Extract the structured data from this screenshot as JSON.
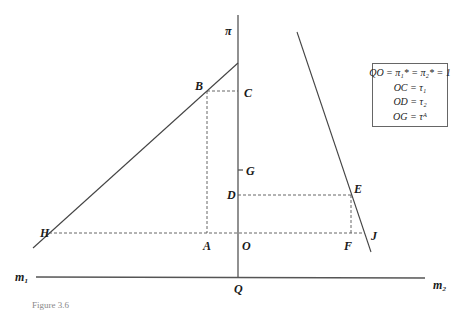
{
  "diagram": {
    "axis_label_vertical": "π",
    "axis_label_left": "m₁",
    "axis_label_right": "m₂",
    "points": {
      "B": "B",
      "C": "C",
      "G": "G",
      "D": "D",
      "E": "E",
      "H": "H",
      "A": "A",
      "O": "O",
      "F": "F",
      "J": "J",
      "Q": "Q"
    },
    "legend": [
      "QO = π₁* = π₂* = 1",
      "OC = τ₁",
      "OD = τ₂",
      "OG = τᴬ"
    ],
    "caption": "Figure 3.6"
  }
}
